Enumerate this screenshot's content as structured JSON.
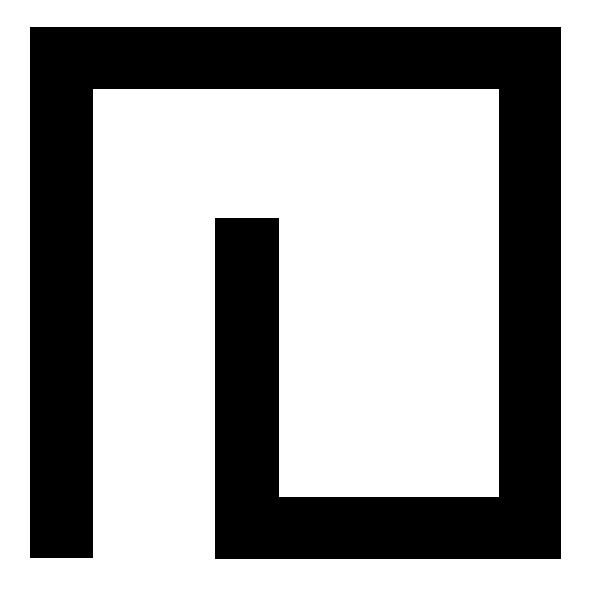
{
  "graphic": {
    "type": "geometric-spiral-mark",
    "description": "Black square spiral / meander shape on white background",
    "colors": {
      "background": "#ffffff",
      "shape": "#000000"
    },
    "segments": [
      {
        "name": "left-outer-bar",
        "x": 30,
        "y": 27,
        "width": 63,
        "height": 531
      },
      {
        "name": "top-bar",
        "x": 30,
        "y": 27,
        "width": 531,
        "height": 62
      },
      {
        "name": "right-bar",
        "x": 499,
        "y": 27,
        "width": 62,
        "height": 532
      },
      {
        "name": "bottom-bar",
        "x": 215,
        "y": 497,
        "width": 346,
        "height": 62
      },
      {
        "name": "inner-vertical-bar",
        "x": 215,
        "y": 218,
        "width": 64,
        "height": 341
      }
    ]
  }
}
